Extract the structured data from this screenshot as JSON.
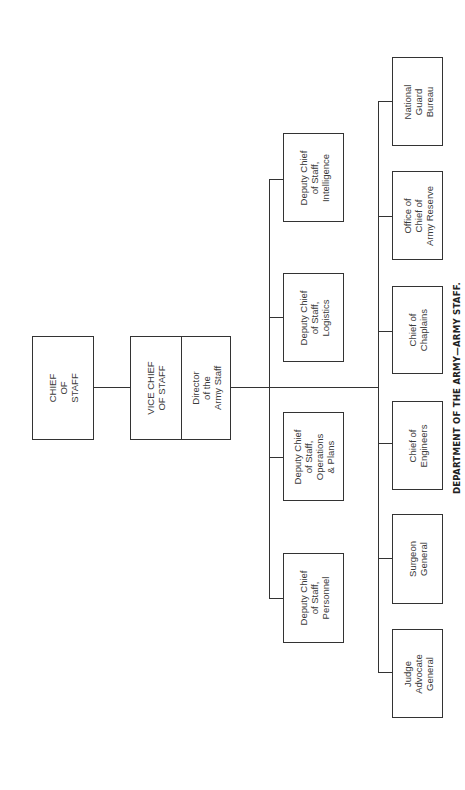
{
  "chart": {
    "caption": "DEPARTMENT OF THE ARMY—ARMY STAFF.",
    "orientation": "rotated-90-ccw",
    "top": {
      "chief_of_staff": "CHIEF\nOF\nSTAFF",
      "vice_chief_of_staff": "VICE CHIEF\nOF STAFF",
      "director_army_staff": "Director\nof the\nArmy Staff"
    },
    "deputy_chiefs": [
      {
        "label": "Deputy Chief\nof Staff,\nIntelligence"
      },
      {
        "label": "Deputy Chief\nof Staff,\nLogistics"
      },
      {
        "label": "Deputy Chief\nof Staff,\nOperations\n& Plans"
      },
      {
        "label": "Deputy Chief\nof Staff,\nPersonnel"
      }
    ],
    "special_staff": [
      {
        "label": "National\nGuard\nBureau"
      },
      {
        "label": "Office of\nChief of\nArmy Reserve"
      },
      {
        "label": "Chief of\nChaplains"
      },
      {
        "label": "Chief of\nEngineers"
      },
      {
        "label": "Surgeon\nGeneral"
      },
      {
        "label": "Judge\nAdvocate\nGeneral"
      }
    ]
  }
}
